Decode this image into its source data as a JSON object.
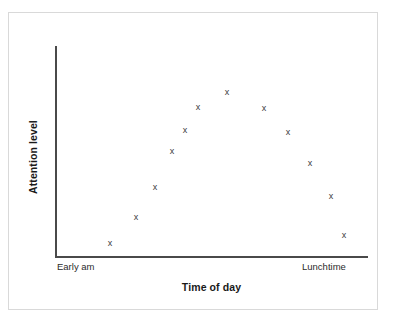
{
  "figure": {
    "background_color": "#ffffff",
    "frame_color": "#d9d9d9",
    "axis_color": "#4a4a4a",
    "marker_color": "#3b3b3b",
    "marker_glyph": "x"
  },
  "chart_data": {
    "type": "scatter",
    "title": "",
    "xlabel": "Time of day",
    "ylabel": "Attention level",
    "xtick_labels": [
      "Early am",
      "Lunchtime"
    ],
    "ytick_labels": [],
    "grid": false,
    "legend": null,
    "axis_values_shown": false,
    "points": [
      {
        "x": 1,
        "y": 1,
        "px": 110,
        "py": 243
      },
      {
        "x": 2,
        "y": 2,
        "px": 136,
        "py": 217
      },
      {
        "x": 3,
        "y": 3,
        "px": 155,
        "py": 187
      },
      {
        "x": 4,
        "y": 5,
        "px": 172,
        "py": 151
      },
      {
        "x": 5,
        "y": 6,
        "px": 185,
        "py": 130
      },
      {
        "x": 6,
        "y": 8,
        "px": 198,
        "py": 107
      },
      {
        "x": 7,
        "y": 10,
        "px": 227,
        "py": 92
      },
      {
        "x": 8,
        "y": 8,
        "px": 264,
        "py": 108
      },
      {
        "x": 9,
        "y": 6,
        "px": 288,
        "py": 132
      },
      {
        "x": 10,
        "y": 4,
        "px": 310,
        "py": 163
      },
      {
        "x": 11,
        "y": 3,
        "px": 331,
        "py": 196
      },
      {
        "x": 12,
        "y": 1,
        "px": 344,
        "py": 235
      }
    ],
    "axis_geometry": {
      "origin_px": [
        55,
        257
      ],
      "x_axis_end_px": [
        368,
        257
      ],
      "y_axis_top_px": [
        55,
        46
      ]
    }
  }
}
